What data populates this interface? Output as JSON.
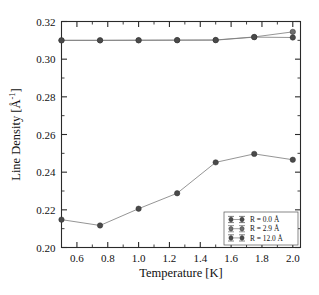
{
  "chart_data": {
    "type": "line",
    "title": "",
    "xlabel": "Temperature [K]",
    "ylabel": "Line Density [Å⁻¹]",
    "ylabel_main": "Line Density [Å",
    "ylabel_exp": "-1",
    "ylabel_tail": "]",
    "xlim": [
      0.5,
      2.05
    ],
    "ylim": [
      0.2,
      0.32
    ],
    "grid": false,
    "legend_position": "lower-right",
    "xticks": [
      0.6,
      0.8,
      1.0,
      1.2,
      1.4,
      1.6,
      1.8,
      2.0
    ],
    "xtick_labels": [
      "0.6",
      "0.8",
      "1.0",
      "1.2",
      "1.4",
      "1.6",
      "1.8",
      "2.0"
    ],
    "xminorticks": [
      0.5,
      0.7,
      0.9,
      1.1,
      1.3,
      1.5,
      1.7,
      1.9
    ],
    "yticks": [
      0.2,
      0.22,
      0.24,
      0.26,
      0.28,
      0.3,
      0.32
    ],
    "ytick_labels": [
      "0.20",
      "0.22",
      "0.24",
      "0.26",
      "0.28",
      "0.30",
      "0.32"
    ],
    "yminorticks": [
      0.21,
      0.23,
      0.25,
      0.27,
      0.29,
      0.31
    ],
    "x": [
      0.5,
      0.75,
      1.0,
      1.25,
      1.5,
      1.75,
      2.0
    ],
    "series": [
      {
        "name": "R = 0.0 Å",
        "marker": "filled-circle",
        "color": "#4a4a4a",
        "values": [
          0.2148,
          0.2117,
          0.2206,
          0.2288,
          0.2452,
          0.2497,
          0.2466
        ],
        "errors": [
          0.0008,
          0.0008,
          0.0008,
          0.0008,
          0.0008,
          0.0008,
          0.0008
        ]
      },
      {
        "name": "R = 2.9 Å",
        "marker": "filled-circle",
        "color": "#6e6e6e",
        "values": [
          0.31,
          0.31,
          0.3101,
          0.3101,
          0.3102,
          0.3118,
          0.3145
        ],
        "errors": [
          0.0006,
          0.0006,
          0.0006,
          0.0006,
          0.0006,
          0.0006,
          0.0006
        ]
      },
      {
        "name": "R = 12.0 Å",
        "marker": "filled-circle",
        "color": "#4a4a4a",
        "values": [
          0.31,
          0.31,
          0.31,
          0.3101,
          0.3101,
          0.3117,
          0.3115
        ],
        "errors": [
          0.0006,
          0.0006,
          0.0006,
          0.0006,
          0.0006,
          0.0006,
          0.0006
        ]
      }
    ]
  },
  "legend": {
    "entries": [
      {
        "label": "R = 0.0 Å"
      },
      {
        "label": "R = 2.9 Å"
      },
      {
        "label": "R = 12.0 Å"
      }
    ]
  },
  "colors": {
    "axis": "#2a2a2a",
    "marker_dark": "#4a4a4a",
    "marker_mid": "#8a8a8a",
    "line": "#7a7a7a",
    "background": "#ffffff"
  }
}
